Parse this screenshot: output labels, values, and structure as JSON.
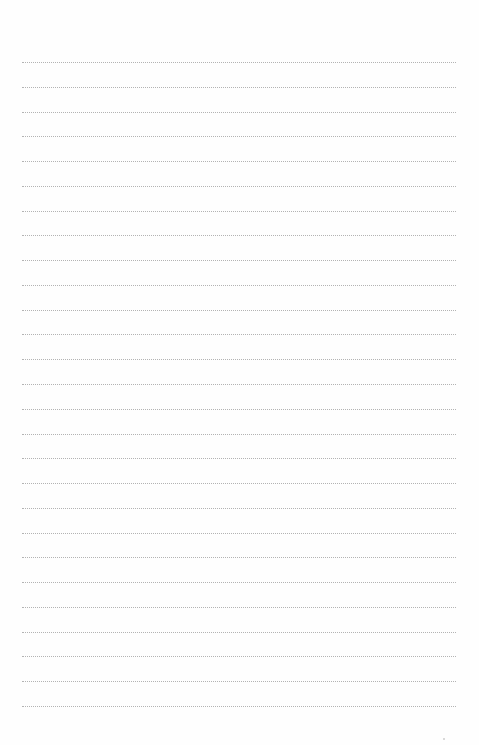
{
  "page": {
    "type": "ruled-notebook-page",
    "line_count": 27,
    "first_line_y": 62,
    "line_spacing": 24.77,
    "line_left": 22,
    "line_width": 434,
    "line_style": "dotted",
    "line_color": "#9a9a9a",
    "background_color": "#fefefe"
  }
}
